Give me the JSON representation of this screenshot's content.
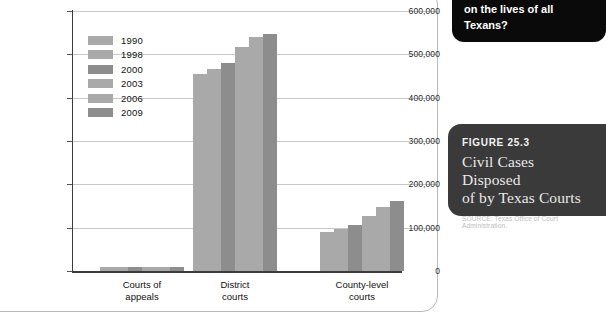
{
  "callout": {
    "text": "on the lives of all Texans?"
  },
  "figure": {
    "kicker": "FIGURE 25.3",
    "title_line1": "Civil Cases Disposed",
    "title_line2": "of by Texas Courts",
    "source": "SOURCE: Texas Office of Court Administration."
  },
  "colors": {
    "bar_light": "#a9a9a9",
    "bar_dark": "#8d8d8d",
    "axis": "#3c3c3c",
    "grid": "#c9c9c9",
    "callout_bg": "#0a0a0a",
    "figure_bg": "#3a3a3a",
    "panel_border": "#b9b9b9"
  },
  "chart_data": {
    "type": "bar",
    "title": "Civil Cases Disposed of by Texas Courts",
    "xlabel": "",
    "ylabel": "",
    "ylim": [
      0,
      600000
    ],
    "ytick_values": [
      0,
      100000,
      200000,
      300000,
      400000,
      500000,
      600000
    ],
    "ytick_labels": [
      "0",
      "100,000",
      "200,000",
      "300,000",
      "400,000",
      "500,000",
      "600,000"
    ],
    "grid": true,
    "legend_position": "inside-upper-left",
    "categories": [
      "Courts of appeals",
      "District courts",
      "County-level courts"
    ],
    "category_labels": [
      {
        "line1": "Courts of",
        "line2": "appeals"
      },
      {
        "line1": "District",
        "line2": "courts"
      },
      {
        "line1": "County-level",
        "line2": "courts"
      }
    ],
    "series": [
      {
        "name": "1990",
        "color": "#a9a9a9",
        "values": [
          10000,
          455000,
          90000
        ]
      },
      {
        "name": "1998",
        "color": "#a9a9a9",
        "values": [
          10000,
          466000,
          96000
        ]
      },
      {
        "name": "2000",
        "color": "#8d8d8d",
        "values": [
          10000,
          481000,
          106000
        ]
      },
      {
        "name": "2003",
        "color": "#a9a9a9",
        "values": [
          10000,
          518000,
          127000
        ]
      },
      {
        "name": "2006",
        "color": "#a9a9a9",
        "values": [
          10000,
          540000,
          148000
        ]
      },
      {
        "name": "2009",
        "color": "#8d8d8d",
        "values": [
          10000,
          548000,
          162000
        ]
      }
    ]
  }
}
